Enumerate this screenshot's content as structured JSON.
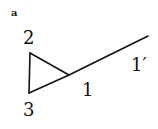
{
  "diagram": {
    "panel_label": "a",
    "nodes": [
      {
        "id": "2",
        "label": "2",
        "x": 30,
        "y": 53
      },
      {
        "id": "3",
        "label": "3",
        "x": 29,
        "y": 93
      },
      {
        "id": "1",
        "label": "1",
        "x": 69,
        "y": 75
      },
      {
        "id": "1p",
        "label": "1′",
        "x": 148,
        "y": 36
      }
    ],
    "edges": [
      {
        "from": "2",
        "to": "3"
      },
      {
        "from": "2",
        "to": "1"
      },
      {
        "from": "3",
        "to": "1"
      },
      {
        "from": "1",
        "to": "1p"
      }
    ],
    "colors": {
      "stroke": "#111111",
      "background": "#ffffff"
    }
  }
}
